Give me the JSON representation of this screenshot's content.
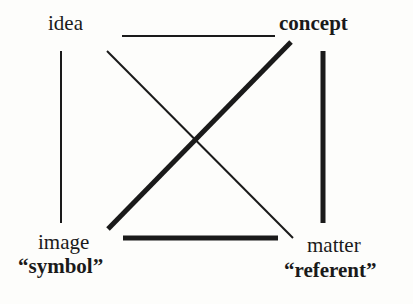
{
  "diagram": {
    "type": "semiotic-square",
    "nodes": {
      "top_left": {
        "label": "idea"
      },
      "top_right": {
        "label": "concept"
      },
      "bottom_left": {
        "label": "image",
        "sublabel": "“symbol”"
      },
      "bottom_right": {
        "label": "matter",
        "sublabel": "“referent”"
      }
    },
    "edges": [
      {
        "from": "idea",
        "to": "concept",
        "weight": "thin"
      },
      {
        "from": "idea",
        "to": "image",
        "weight": "thin"
      },
      {
        "from": "idea",
        "to": "matter",
        "weight": "thin"
      },
      {
        "from": "concept",
        "to": "image",
        "weight": "thick"
      },
      {
        "from": "concept",
        "to": "matter",
        "weight": "thick"
      },
      {
        "from": "image",
        "to": "matter",
        "weight": "thick"
      }
    ],
    "line_color": "#1a1a1a"
  }
}
